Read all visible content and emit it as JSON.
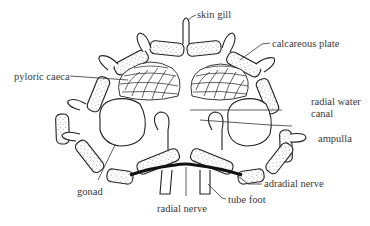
{
  "diagram": {
    "labels": {
      "skin_gill": "skin gill",
      "calcareous_plate": "calcareous plate",
      "pyloric_caeca": "pyloric caeca",
      "radial_water_canal_line1": "radial water",
      "radial_water_canal_line2": "canal",
      "ampulla": "ampulla",
      "adradial_nerve": "adradial nerve",
      "gonad": "gonad",
      "radial_nerve": "radial nerve",
      "tube_foot": "tube foot"
    },
    "colors": {
      "line": "#222222",
      "text": "#3a3a3a",
      "background": "#ffffff"
    }
  }
}
